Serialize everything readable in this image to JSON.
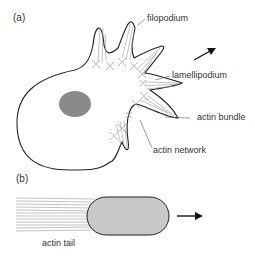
{
  "panels": {
    "a": {
      "label": "(a)"
    },
    "b": {
      "label": "(b)"
    }
  },
  "labels": {
    "filopodium": "filopodium",
    "lamellipodium": "lamellipodium",
    "actin_bundle": "actin bundle",
    "actin_network": "actin network",
    "actin_tail": "actin tail"
  },
  "colors": {
    "outline": "#222222",
    "nucleus": "#8a8a8a",
    "bead": "#c8c8c8",
    "filament": "#999999",
    "arrow": "#111111"
  }
}
